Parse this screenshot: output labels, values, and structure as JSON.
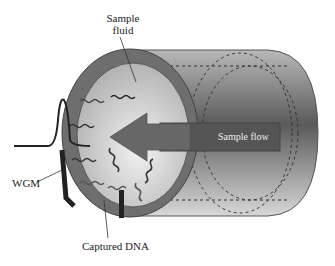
{
  "labels": {
    "sample_fluid_line1": "Sample",
    "sample_fluid_line2": "fluid",
    "sample_flow": "Sample flow",
    "wgm": "WGM",
    "captured_dna": "Captured DNA"
  },
  "colors": {
    "ring": "#6e6e6e",
    "interior_light": "#e8e8e8",
    "interior_dark": "#b5b5b5",
    "tube_light": "#cfcfcf",
    "tube_dark": "#555555",
    "arrow": "#666666",
    "resonator": "#222222"
  }
}
